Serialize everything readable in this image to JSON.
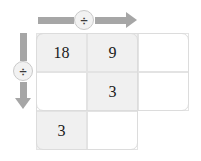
{
  "canvas": {
    "width": 201,
    "height": 161,
    "background": "#ffffff"
  },
  "theme": {
    "arrow_color": "#a6a6a6",
    "cell_shaded": "#f0f0f0",
    "cell_empty": "#ffffff",
    "grid_line": "#e3e3e3",
    "outline": "#dcdcdc",
    "text_color": "#1a1a1a"
  },
  "operators": {
    "column_operator": {
      "symbol": "÷",
      "name": "division",
      "direction": "right",
      "label": "column-divide-arrow"
    },
    "row_operator": {
      "symbol": "÷",
      "name": "division",
      "direction": "down",
      "label": "row-divide-arrow"
    }
  },
  "grid": {
    "columns": 3,
    "rows": 3,
    "cells": [
      {
        "row": 1,
        "col": 1,
        "value": "18",
        "filled": true
      },
      {
        "row": 1,
        "col": 2,
        "value": "9",
        "filled": true
      },
      {
        "row": 1,
        "col": 3,
        "value": "",
        "filled": false
      },
      {
        "row": 2,
        "col": 1,
        "value": "",
        "filled": false
      },
      {
        "row": 2,
        "col": 2,
        "value": "3",
        "filled": true
      },
      {
        "row": 2,
        "col": 3,
        "value": "",
        "filled": false
      },
      {
        "row": 3,
        "col": 1,
        "value": "3",
        "filled": true
      },
      {
        "row": 3,
        "col": 2,
        "value": "",
        "filled": false
      }
    ]
  },
  "cell_values": {
    "r1c1": "18",
    "r1c2": "9",
    "r1c3": "",
    "r2c1": "",
    "r2c2": "3",
    "r2c3": "",
    "r3c1": "3",
    "r3c2": ""
  }
}
